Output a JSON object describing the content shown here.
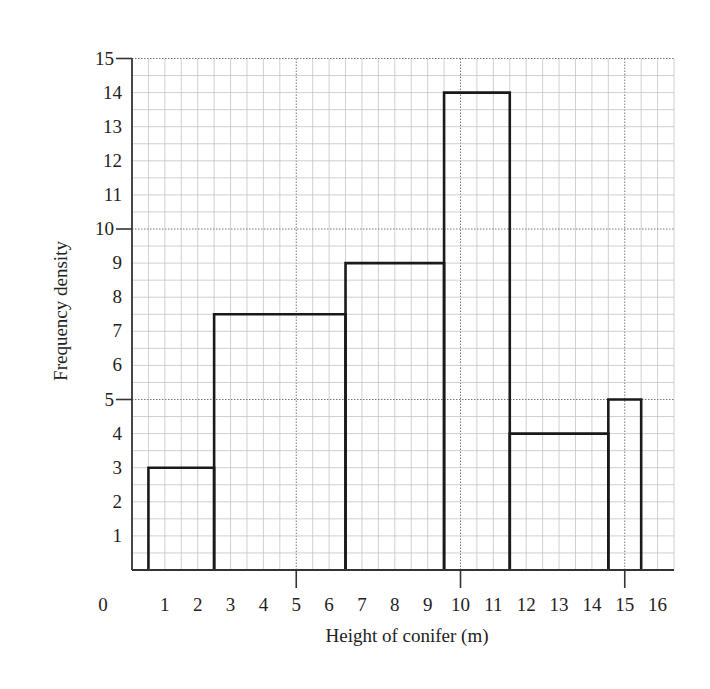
{
  "chart_data": {
    "type": "histogram",
    "title": "",
    "xlabel": "Height of conifer (m)",
    "ylabel": "Frequency density",
    "xlim": [
      0,
      16.5
    ],
    "ylim": [
      0,
      15
    ],
    "grid": true,
    "x_ticks": [
      "0",
      "1",
      "2",
      "3",
      "4",
      "5",
      "6",
      "7",
      "8",
      "9",
      "10",
      "11",
      "12",
      "13",
      "14",
      "15",
      "16"
    ],
    "y_ticks": [
      "1",
      "2",
      "3",
      "4",
      "5",
      "6",
      "7",
      "8",
      "9",
      "10",
      "11",
      "12",
      "13",
      "14",
      "15"
    ],
    "bins": [
      {
        "from": 0.5,
        "to": 2.5,
        "frequency_density": 3
      },
      {
        "from": 2.5,
        "to": 6.5,
        "frequency_density": 7.5
      },
      {
        "from": 6.5,
        "to": 9.5,
        "frequency_density": 9
      },
      {
        "from": 9.5,
        "to": 11.5,
        "frequency_density": 14
      },
      {
        "from": 11.5,
        "to": 14.5,
        "frequency_density": 4
      },
      {
        "from": 14.5,
        "to": 15.5,
        "frequency_density": 5
      }
    ]
  },
  "labels": {
    "xlabel": "Height of conifer (m)",
    "ylabel": "Frequency density"
  }
}
